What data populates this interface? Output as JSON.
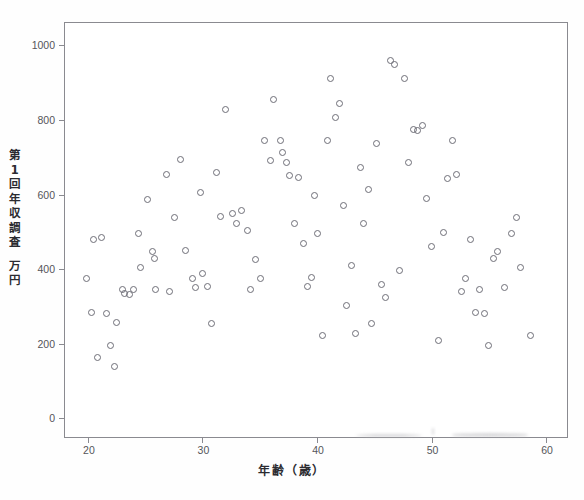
{
  "chart_data": {
    "type": "scatter",
    "title": "",
    "xlabel": "年齢（歳）",
    "ylabel": "第1回年収調査　万円",
    "ylabel_lines": [
      "第",
      "1",
      "回",
      "年",
      "収",
      "調",
      "査",
      "万",
      "円"
    ],
    "xlim": [
      18,
      62
    ],
    "ylim": [
      -55,
      1060
    ],
    "xticks": [
      20,
      30,
      40,
      50,
      60
    ],
    "xtick_labels": [
      "20",
      "30",
      "40",
      "50",
      "60"
    ],
    "yticks": [
      0,
      200,
      400,
      600,
      800,
      1000
    ],
    "ytick_labels": [
      "0",
      "200",
      "400",
      "600",
      "800",
      "1000"
    ],
    "grid": false,
    "legend": null,
    "marker": "open-circle",
    "marker_color": "#6e6e77",
    "series_name": "第1回年収調査",
    "n_points": 99,
    "x": [
      19.9,
      20.3,
      20.5,
      20.8,
      21.2,
      21.6,
      22.0,
      22.3,
      22.5,
      23.0,
      23.2,
      23.6,
      24.0,
      24.4,
      24.6,
      25.2,
      25.6,
      25.8,
      25.9,
      26.9,
      27.1,
      27.6,
      28.1,
      28.5,
      29.1,
      29.4,
      29.8,
      30.0,
      30.4,
      30.8,
      31.2,
      31.6,
      32.0,
      32.6,
      33.0,
      33.4,
      33.9,
      34.2,
      34.6,
      35.1,
      35.4,
      35.9,
      36.2,
      36.8,
      37.0,
      37.3,
      37.6,
      38.0,
      38.4,
      38.8,
      39.2,
      39.5,
      39.8,
      40.0,
      40.5,
      40.9,
      41.2,
      41.6,
      42.0,
      42.3,
      42.6,
      43.0,
      43.4,
      43.8,
      44.1,
      44.5,
      44.8,
      45.2,
      45.6,
      46.0,
      46.4,
      46.8,
      47.2,
      47.6,
      48.0,
      48.4,
      48.8,
      49.2,
      49.6,
      50.0,
      50.6,
      51.0,
      51.4,
      51.8,
      52.2,
      52.6,
      53.0,
      53.4,
      53.8,
      54.2,
      54.6,
      55.0,
      55.4,
      55.8,
      56.4,
      57.0,
      57.4,
      57.8,
      58.6
    ],
    "y": [
      374,
      285,
      480,
      163,
      486,
      281,
      195,
      140,
      257,
      345,
      335,
      332,
      345,
      497,
      404,
      588,
      448,
      430,
      347,
      653,
      340,
      538,
      693,
      450,
      375,
      352,
      607,
      389,
      355,
      254,
      658,
      542,
      828,
      550,
      523,
      558,
      505,
      347,
      426,
      376,
      744,
      692,
      856,
      745,
      712,
      685,
      650,
      523,
      645,
      468,
      355,
      378,
      598,
      497,
      222,
      745,
      912,
      808,
      843,
      570,
      303,
      410,
      227,
      673,
      523,
      615,
      255,
      737,
      360,
      325,
      960,
      948,
      397,
      910,
      685,
      775,
      772,
      785,
      590,
      462,
      208,
      499,
      644,
      744,
      653,
      340,
      375,
      480,
      285,
      347,
      281,
      195,
      430,
      448,
      350,
      497,
      538,
      404,
      222
    ]
  },
  "artifacts": {
    "smudge_a": "scan-smudge",
    "smudge_b": "scan-smudge",
    "smudge_c": "scan-speck"
  }
}
